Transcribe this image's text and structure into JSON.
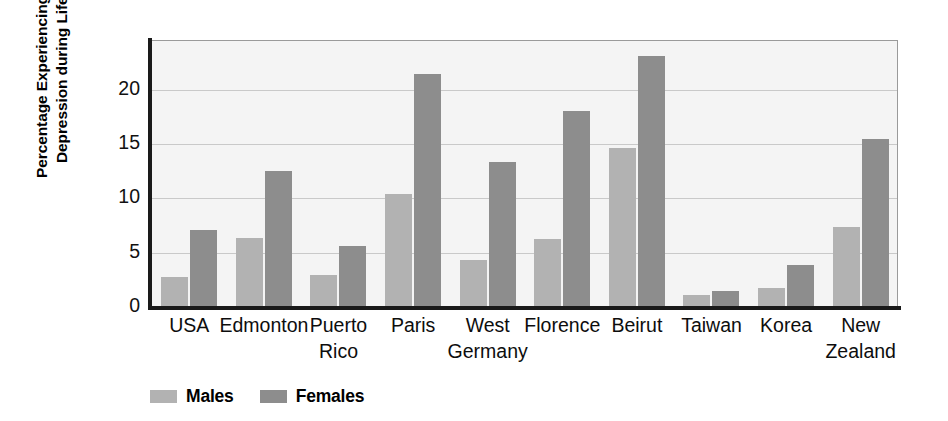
{
  "chart_data": {
    "type": "bar",
    "title": "",
    "xlabel": "",
    "ylabel": "Percentage Experiencing Major\nDepression during Lifetime",
    "ylim": [
      0,
      24.5
    ],
    "yticks": [
      0,
      5,
      10,
      15,
      20
    ],
    "ytick_labels": [
      "0",
      "5",
      "10",
      "15",
      "20"
    ],
    "grid": "horizontal",
    "legend_position": "bottom-left",
    "categories": [
      "USA",
      "Edmonton",
      "Puerto\nRico",
      "Paris",
      "West\nGermany",
      "Florence",
      "Beirut",
      "Taiwan",
      "Korea",
      "New\nZealand"
    ],
    "series": [
      {
        "name": "Males",
        "color": "#b2b2b2",
        "values": [
          2.7,
          6.3,
          2.9,
          10.3,
          4.2,
          6.2,
          14.6,
          1.0,
          1.7,
          7.3
        ]
      },
      {
        "name": "Females",
        "color": "#8d8d8d",
        "values": [
          7.0,
          12.4,
          5.5,
          21.4,
          13.3,
          18.0,
          23.0,
          1.4,
          3.8,
          15.4
        ]
      }
    ]
  },
  "legend": {
    "items": [
      {
        "label": "Males",
        "color": "#b2b2b2"
      },
      {
        "label": "Females",
        "color": "#8d8d8d"
      }
    ]
  },
  "colors": {
    "male_bar": "#b2b2b2",
    "female_bar": "#8d8d8d",
    "plot_background": "#f4f4f4",
    "gridline": "#c9c9c9",
    "axis": "#1a1a1a",
    "text": "#000000"
  }
}
